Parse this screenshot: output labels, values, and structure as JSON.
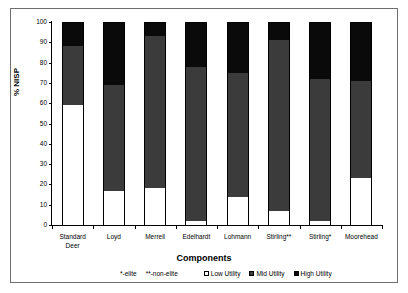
{
  "chart_data": {
    "type": "bar",
    "subtype": "stacked-percentage",
    "title": "",
    "xlabel": "Components",
    "ylabel": "% NISP",
    "ylim": [
      0,
      100
    ],
    "ytick_step": 10,
    "grid": false,
    "legend_position": "bottom",
    "categories": [
      "Standard\nDeer",
      "Loyd",
      "Merrell",
      "Edelhardt",
      "Lohmann",
      "Stirling**",
      "Stirling*",
      "Moorehead"
    ],
    "yticks": [
      0,
      10,
      20,
      30,
      40,
      50,
      60,
      70,
      80,
      90,
      100
    ],
    "ytick_labels": [
      "0",
      "10",
      "20",
      "30",
      "40",
      "50",
      "60",
      "70",
      "80",
      "90",
      "100"
    ],
    "series": [
      {
        "name": "Low Utility",
        "color": "#ffffff",
        "values": [
          59,
          17,
          18,
          2,
          14,
          7,
          2,
          23
        ]
      },
      {
        "name": "Mid Utility",
        "color": "#3b3b3b",
        "values": [
          29,
          52,
          75,
          76,
          61,
          84,
          70,
          48
        ]
      },
      {
        "name": "High Utility",
        "color": "#0a0a0a",
        "values": [
          12,
          31,
          7,
          22,
          25,
          9,
          28,
          29
        ]
      }
    ],
    "cumulative_tops": {
      "low": [
        59,
        17,
        18,
        2,
        14,
        7,
        2,
        23
      ],
      "mid": [
        88,
        69,
        93,
        78,
        75,
        91,
        72,
        71
      ],
      "high": [
        100,
        100,
        100,
        100,
        100,
        100,
        100,
        100
      ]
    },
    "annotations": [
      "*-elite",
      "**-non-elite"
    ]
  },
  "legend": {
    "notes": [
      "*-elite",
      "**-non-elite"
    ],
    "entries": [
      {
        "label": "Low Utility",
        "swatch": "sw-low"
      },
      {
        "label": "Mid Utility",
        "swatch": "sw-mid"
      },
      {
        "label": "High Utility",
        "swatch": "sw-high"
      }
    ]
  }
}
